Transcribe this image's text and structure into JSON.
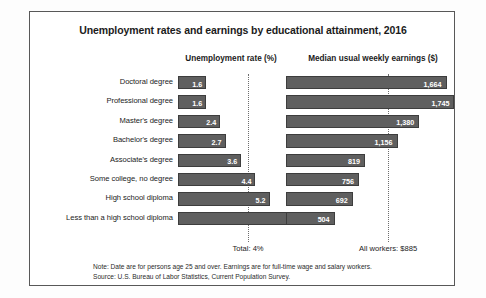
{
  "chart_data": {
    "type": "bar",
    "title": "Unemployment rates and earnings by educational attainment, 2016",
    "orientation": "horizontal",
    "grid": false,
    "legend": "none",
    "panels": [
      {
        "name": "unemployment",
        "header": "Unemployment rate (%)",
        "xlabel": "Unemployment rate (%)",
        "unit": "percent",
        "xlim": [
          0,
          8
        ],
        "reference_line": {
          "label": "Total: 4%",
          "value": 4
        }
      },
      {
        "name": "earnings",
        "header": "Median usual weekly earnings ($)",
        "xlabel": "Median usual weekly earnings ($)",
        "unit": "dollars",
        "xlim": [
          0,
          1800
        ],
        "reference_line": {
          "label": "All workers: $885",
          "value": 885
        }
      }
    ],
    "categories": [
      "Doctoral degree",
      "Professional degree",
      "Master's degree",
      "Bachelor's degree",
      "Associate's degree",
      "Some college, no degree",
      "High school diploma",
      "Less than a high school diploma"
    ],
    "series": [
      {
        "name": "Unemployment rate (%)",
        "panel": "unemployment",
        "values": [
          1.6,
          1.6,
          2.4,
          2.7,
          3.6,
          4.4,
          5.2,
          7.4
        ],
        "labels": [
          "1.6",
          "1.6",
          "2.4",
          "2.7",
          "3.6",
          "4.4",
          "5.2",
          "7.4"
        ]
      },
      {
        "name": "Median usual weekly earnings ($)",
        "panel": "earnings",
        "values": [
          1664,
          1745,
          1380,
          1156,
          819,
          756,
          692,
          504
        ],
        "labels": [
          "1,664",
          "1,745",
          "1,380",
          "1,156",
          "819",
          "756",
          "692",
          "504"
        ]
      }
    ],
    "bar_color": "#5f5f5f",
    "annotations": [
      "Note: Date are for persons age 25 and over. Earnings are for full-time wage and salary workers.",
      "Source: U.S. Bureau of Labor Statistics, Current Population Survey."
    ]
  },
  "notes": {
    "line1": "Note: Date are for persons age 25 and over. Earnings are for full-time wage and salary workers.",
    "line2": "Source: U.S. Bureau of Labor Statistics, Current Population Survey."
  }
}
